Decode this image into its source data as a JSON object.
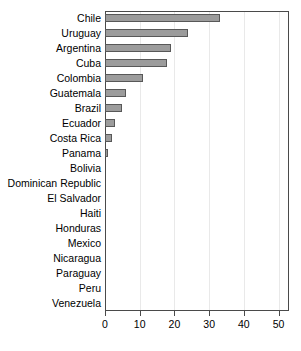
{
  "chart_data": {
    "type": "bar",
    "orientation": "horizontal",
    "title": "",
    "subtitle": "",
    "xlabel": "",
    "ylabel": "",
    "xlim": [
      0,
      53
    ],
    "ylim": null,
    "grid": true,
    "legend": null,
    "legend_position": "none",
    "xticks": [
      0,
      10,
      20,
      30,
      40,
      50
    ],
    "xticklabels": [
      "0",
      "10",
      "20",
      "30",
      "40",
      "50"
    ],
    "categories": [
      "Chile",
      "Uruguay",
      "Argentina",
      "Cuba",
      "Colombia",
      "Guatemala",
      "Brazil",
      "Ecuador",
      "Costa Rica",
      "Panama",
      "Bolivia",
      "Dominican Republic",
      "El Salvador",
      "Haiti",
      "Honduras",
      "Mexico",
      "Nicaragua",
      "Paraguay",
      "Peru",
      "Venezuela"
    ],
    "values": [
      33,
      24,
      19,
      18,
      11,
      6,
      5,
      3,
      2,
      1,
      0,
      0,
      0,
      0,
      0,
      0,
      0,
      0,
      0,
      0
    ],
    "annotations": []
  },
  "style": {
    "bar_fill": "#9c9c9c",
    "bar_edge": "#585858",
    "frame_color": "#4a4a4a",
    "grid_color": "#e9e9e9",
    "background": "#ffffff",
    "text_color": "#000000"
  }
}
